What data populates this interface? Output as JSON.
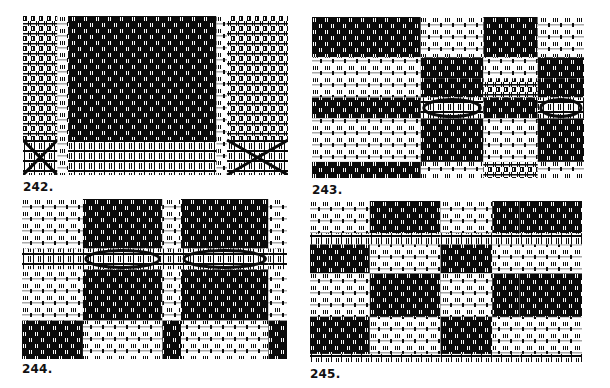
{
  "figure": {
    "background": "#ffffff",
    "ink": "#0a0a0a",
    "panels": [
      {
        "id": "242",
        "label": "242.",
        "box": {
          "x": 23,
          "y": 16,
          "w": 265,
          "h": 159
        },
        "label_pos": {
          "x": 23,
          "y": 180
        },
        "description": "Large dark block field with light borders, cross-over curve motif along the bottom band",
        "cols": [
          0.0,
          0.13,
          0.17,
          0.73,
          0.77,
          1.0
        ],
        "rows": [
          0.0,
          0.78,
          1.0
        ],
        "grid": [
          [
            "mixed",
            "light",
            "dark",
            "light",
            "mixed"
          ],
          [
            "cross",
            "light",
            "band",
            "light",
            "cross"
          ]
        ]
      },
      {
        "id": "243",
        "label": "243.",
        "box": {
          "x": 312,
          "y": 17,
          "w": 272,
          "h": 161
        },
        "label_pos": {
          "x": 312,
          "y": 183
        },
        "description": "Alternating horizontal bands; left half solid blocks, right half circular overshot motifs",
        "cols": [
          0.0,
          0.4,
          0.63,
          0.83,
          1.0
        ],
        "rows": [
          0.0,
          0.25,
          0.38,
          0.5,
          0.63,
          0.9,
          1.0
        ],
        "grid": [
          [
            "dark",
            "light",
            "dark",
            "light"
          ],
          [
            "light",
            "dark",
            "light",
            "dark"
          ],
          [
            "light",
            "dark",
            "mixed",
            "dark"
          ],
          [
            "dark",
            "circle",
            "dark",
            "circle"
          ],
          [
            "light",
            "dark",
            "light",
            "dark"
          ],
          [
            "dark",
            "light",
            "mixed",
            "light"
          ]
        ]
      },
      {
        "id": "244",
        "label": "244.",
        "box": {
          "x": 22,
          "y": 199,
          "w": 265,
          "h": 160
        },
        "label_pos": {
          "x": 22,
          "y": 362
        },
        "description": "Checkered blocks with circular star motifs across the middle band",
        "cols": [
          0.0,
          0.23,
          0.53,
          0.6,
          0.93,
          1.0
        ],
        "rows": [
          0.0,
          0.31,
          0.44,
          0.76,
          1.0
        ],
        "grid": [
          [
            "light",
            "dark",
            "light",
            "dark",
            "light"
          ],
          [
            "band",
            "circle",
            "band",
            "circle",
            "band"
          ],
          [
            "light",
            "dark",
            "light",
            "dark",
            "light"
          ],
          [
            "dark",
            "light",
            "dark",
            "light",
            "dark"
          ]
        ]
      },
      {
        "id": "245",
        "label": "245.",
        "box": {
          "x": 310,
          "y": 201,
          "w": 272,
          "h": 161
        },
        "label_pos": {
          "x": 310,
          "y": 367
        },
        "description": "Plaid-like checkerboard of dotted dark and light blocks",
        "cols": [
          0.0,
          0.22,
          0.48,
          0.67,
          0.77,
          1.0
        ],
        "rows": [
          0.0,
          0.2,
          0.27,
          0.45,
          0.72,
          0.95,
          1.0
        ],
        "grid": [
          [
            "light",
            "dark",
            "light",
            "dark",
            "dark"
          ],
          [
            "band",
            "band",
            "band",
            "band",
            "band"
          ],
          [
            "dark",
            "light",
            "dark",
            "light",
            "light"
          ],
          [
            "light",
            "dark",
            "light",
            "dark",
            "dark"
          ],
          [
            "dark",
            "light",
            "dark",
            "light",
            "light"
          ],
          [
            "band",
            "band",
            "band",
            "band",
            "band"
          ]
        ]
      }
    ]
  }
}
